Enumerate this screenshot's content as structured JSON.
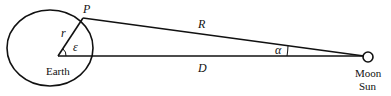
{
  "diagram": {
    "labels": {
      "point": "P",
      "radius": "r",
      "angle_center": "ε",
      "distance_slant": "R",
      "distance_center": "D",
      "angle_far": "α",
      "earth": "Earth",
      "moon": "Moon",
      "sun": "Sun"
    },
    "colors": {
      "stroke": "#111111",
      "background": "#ffffff"
    }
  }
}
